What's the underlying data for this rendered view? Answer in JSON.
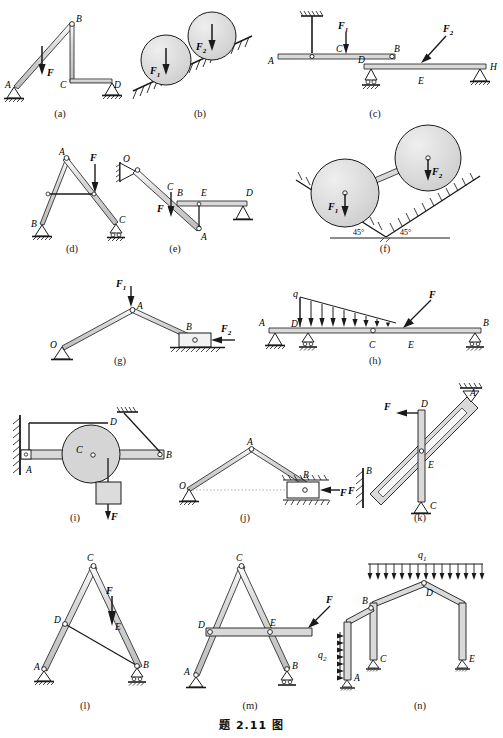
{
  "document": {
    "main_caption": "题 2.11  图",
    "type": "engineering-mechanics-figure-plate",
    "subfigure_count": 14
  },
  "subfigures": [
    {
      "key": "a",
      "label": "(a)",
      "points": [
        "A",
        "B",
        "C",
        "D"
      ],
      "forces": [
        "F"
      ],
      "supports": [
        "pin",
        "pin"
      ],
      "description": "Inclined bar AB pinned at A, vertical member BC, horizontal member CD on pin support at D, vertical load F on AB"
    },
    {
      "key": "b",
      "label": "(b)",
      "points": [],
      "forces": [
        "F1",
        "F2"
      ],
      "supports": [
        "inclined-ground",
        "inclined-ground"
      ],
      "description": "Two circular cylinders resting in a V formed by inclined hatched surfaces, loaded by vertical forces F1 and F2"
    },
    {
      "key": "c",
      "label": "(c)",
      "points": [
        "A",
        "B",
        "C",
        "D",
        "E",
        "H"
      ],
      "forces": [
        "F1",
        "F2"
      ],
      "supports": [
        "hanger",
        "roller-pin",
        "pin"
      ],
      "description": "Beam AB hung by vertical rod at A from ceiling with load F1 at C; beam DH with pin support near D, roller at H and oblique load F2 near E"
    },
    {
      "key": "d",
      "label": "(d)",
      "points": [
        "A",
        "B",
        "C"
      ],
      "forces": [
        "F"
      ],
      "supports": [
        "pin",
        "roller"
      ],
      "description": "Two-bar frame A-B and A-C with horizontal tie member; vertical load F on bar AC"
    },
    {
      "key": "e",
      "label": "(e)",
      "points": [
        "O",
        "A",
        "B",
        "C",
        "D",
        "E"
      ],
      "forces": [
        "F"
      ],
      "supports": [
        "wall-pin",
        "roller"
      ],
      "description": "Inclined bar OA pinned to wall bracket at O with vertical load F at C; horizontal bar BD supported at D on roller, connected to bar by vertical link E-A"
    },
    {
      "key": "f",
      "label": "(f)",
      "points": [],
      "forces": [
        "F1",
        "F2"
      ],
      "supports": [
        "45-degree-incline",
        "45-degree-incline"
      ],
      "angles": [
        "45°",
        "45°"
      ],
      "description": "Two cylinders connected by a bar resting in a symmetric 45° V-groove, loaded by F1 and F2"
    },
    {
      "key": "g",
      "label": "(g)",
      "points": [
        "O",
        "A",
        "B"
      ],
      "forces": [
        "F1",
        "F2"
      ],
      "supports": [
        "pin",
        "slider-block"
      ],
      "description": "Two-bar mechanism OA and AB, pin at O, slider block B on horizontal ground, vertical load F1 at A and horizontal load F2 on slider"
    },
    {
      "key": "h",
      "label": "(h)",
      "points": [
        "A",
        "B",
        "C",
        "D",
        "E"
      ],
      "forces": [
        "q",
        "F"
      ],
      "supports": [
        "pin",
        "roller",
        "roller"
      ],
      "description": "Continuous beam A-B with internal hinge at C, triangular distributed load q from D to E and oblique concentrated load F at E"
    },
    {
      "key": "i",
      "label": "(i)",
      "points": [
        "A",
        "B",
        "C",
        "D"
      ],
      "forces": [
        "F"
      ],
      "supports": [
        "wall-fixed",
        "wall-hatch"
      ],
      "description": "Horizontal beam AB fixed to wall at A carrying pulley/disc C, tie rod DB to ceiling bracket, hanging weight with force F"
    },
    {
      "key": "j",
      "label": "(j)",
      "points": [
        "O",
        "A",
        "B"
      ],
      "forces": [
        "F"
      ],
      "supports": [
        "pin",
        "horizontal-guide"
      ],
      "description": "Two-bar linkage OA-AB with slider B in horizontal guide loaded by horizontal force F"
    },
    {
      "key": "k",
      "label": "(k)",
      "points": [
        "A",
        "B",
        "C",
        "D",
        "E"
      ],
      "forces": [
        "F",
        "F"
      ],
      "supports": [
        "roller-top",
        "wall-hatch",
        "pin"
      ],
      "description": "Inclined slotted bar from B at wall to roller at A, with vertical bar DC pinned at C passing through slot at E, horizontal load F at D"
    },
    {
      "key": "l",
      "label": "(l)",
      "points": [
        "A",
        "B",
        "C",
        "D",
        "E"
      ],
      "forces": [
        "F"
      ],
      "supports": [
        "pin",
        "roller"
      ],
      "description": "Triangular frame ACB with tie bar DB; vertical load F applied at E on member CB"
    },
    {
      "key": "m",
      "label": "(m)",
      "points": [
        "A",
        "B",
        "C",
        "D",
        "E"
      ],
      "forces": [
        "F"
      ],
      "supports": [
        "pin",
        "roller"
      ],
      "description": "Triangular frame ACB with horizontal member through D and E extending right; oblique load F on the overhang"
    },
    {
      "key": "n",
      "label": "(n)",
      "points": [
        "A",
        "B",
        "C",
        "D",
        "E"
      ],
      "forces": [
        "q1",
        "q2"
      ],
      "supports": [
        "roller",
        "roller",
        "roller"
      ],
      "description": "Portal frame with pitched roof; uniform vertical load q1 on roof, triangular horizontal load q2 on left column"
    }
  ],
  "labels": {
    "A": "A",
    "B": "B",
    "C": "C",
    "D": "D",
    "E": "E",
    "H": "H",
    "O": "O",
    "F": "F",
    "F1": "F",
    "F2": "F",
    "q": "q",
    "sub1": "1",
    "sub2": "2",
    "angle45": "45°"
  },
  "colors": {
    "line": "#1a1a1a",
    "member_fill": "#d4d4d4",
    "member_fill_light": "#e2e2e2",
    "circle_fill": "#d8d8d8",
    "background": "#ffffff",
    "hatch": "#1a1a1a"
  }
}
